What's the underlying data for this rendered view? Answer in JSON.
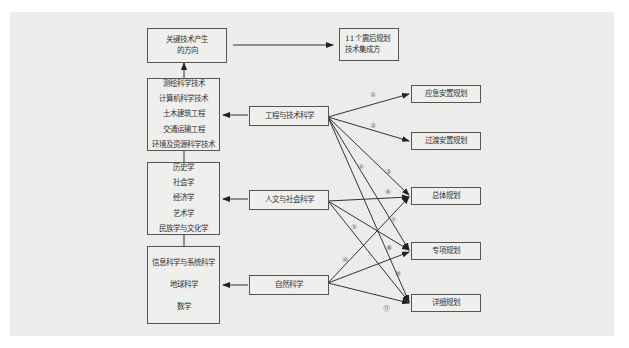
{
  "diagram": {
    "top_left_box": [
      "关键技术产生",
      "的方向"
    ],
    "top_right_box": [
      "11个震后规划",
      "技术集成方"
    ],
    "discipline_groups": [
      {
        "id": "engineering",
        "items": [
          "测绘科学技术",
          "计算机科学技术",
          "土木建筑工程",
          "交通运输工程",
          "环境及资源科学技术"
        ]
      },
      {
        "id": "humanities",
        "items": [
          "历史学",
          "社会学",
          "经济学",
          "艺术学",
          "民族学与文化学"
        ]
      },
      {
        "id": "natural",
        "items": [
          "信息科学与系统科学",
          "地球科学",
          "数学"
        ]
      }
    ],
    "categories": [
      {
        "id": "engineering",
        "label": "工程与技术科学"
      },
      {
        "id": "humanities",
        "label": "人文与社会科学"
      },
      {
        "id": "natural",
        "label": "自然科学"
      }
    ],
    "plans": [
      {
        "id": "emergency",
        "label": "应急安置规划"
      },
      {
        "id": "transition",
        "label": "过渡安置规划"
      },
      {
        "id": "master",
        "label": "总体规划"
      },
      {
        "id": "special",
        "label": "专项规划"
      },
      {
        "id": "detailed",
        "label": "详细规划"
      }
    ],
    "link_labels": [
      "①",
      "②",
      "③",
      "④",
      "⑤",
      "⑥",
      "⑦",
      "⑧",
      "⑨",
      "⑩",
      "⑪"
    ],
    "colors": {
      "line": "#333333",
      "box_border": "#555555",
      "panel_bg": "#ececeb",
      "page_bg": "#ffffff"
    }
  }
}
